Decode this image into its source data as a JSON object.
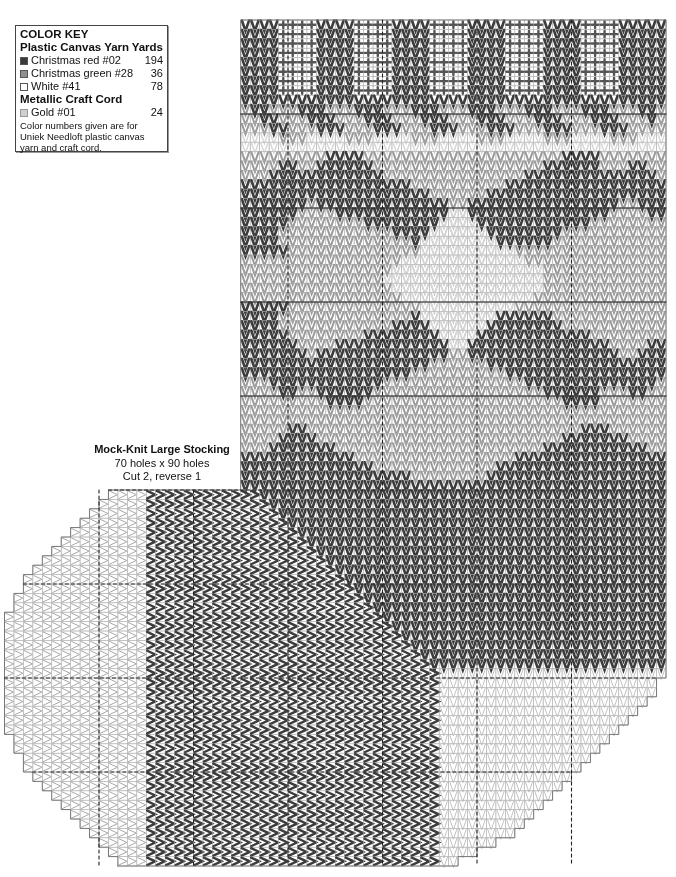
{
  "color_key": {
    "title": "COLOR KEY",
    "yarn_heading": "Plastic Canvas Yarn",
    "yards_heading": "Yards",
    "yarn_items": [
      {
        "name": "Christmas red #02",
        "yards": "194",
        "swatch": "#3a3a3a"
      },
      {
        "name": "Christmas green #28",
        "yards": "36",
        "swatch": "#8f8f8f"
      },
      {
        "name": "White #41",
        "yards": "78",
        "swatch": "#ffffff"
      }
    ],
    "cord_heading": "Metallic Craft Cord",
    "cord_items": [
      {
        "name": "Gold #01",
        "yards": "24",
        "swatch": "#cfcfcf"
      }
    ],
    "note": "Color numbers given are for Uniek Needloft plastic canvas yarn and craft cord."
  },
  "pattern_label": {
    "title": "Mock-Knit Large Stocking",
    "size": "70 holes x 90 holes",
    "cut": "Cut 2, reverse 1"
  },
  "chart_data": {
    "type": "stitch-chart",
    "title": "Mock-Knit Large Stocking",
    "grid": {
      "holes_wide": 70,
      "holes_high": 90,
      "major_every": 10
    },
    "colors": {
      "R": "#3c3c3c",
      "G": "#9a9a9a",
      "W": "#d6d6d6",
      "Y": "#bdbdbd"
    },
    "leg": {
      "start_col": 25,
      "cols": 45,
      "rows": 50
    },
    "foot": {
      "start_row": 50,
      "rows": 40
    },
    "leg_rows": [
      "RRRRWWWWRRRRWWWWRRRRWWWWRRRRWWWWRRRRWWWWRRRRR",
      "RRRRWWWWRRRRWWWWRRRRWWWWRRRRWWWWRRRRWWWWRRRRR",
      "RRRRWWWWRRRRWWWWRRRRWWWWRRRRWWWWRRRRWWWWRRRRR",
      "RRRRWWWWRRRRWWWWRRRRWWWWRRRRWWWWRRRRWWWWRRRRR",
      "RRRRWWWWRRRRWWWWRRRRWWWWRRRRWWWWRRRRWWWWRRRRR",
      "RRRRWWWWRRRRWWWWRRRRWWWWRRRRWWWWRRRRWWWWRRRRR",
      "RRRRWWWWRRRRWWWWRRRRWWWWRRRRWWWWRRRRWWWWRRRRR",
      "RRRRWWWWRRRRWWWWRRRRWWWWRRRRWWWWRRRRWWWWRRRRR",
      "RRRRRRRRRRRRRRRRRRRRRRRRRRRRRRRRRRRRRRRRRRRRR",
      "GRRGGGRRRGGGRRRGGGRRRGGGRRRGGGRRRGGGRRRGGGRRG",
      "GGRRGGGRRRGGGRRRGGGRRRGGGRRRGGGRRRGGGRRRGGGRG",
      "GGGRRGGGRRRGGGRRRGGGRRRGGGRRRGGGRRRGGGRRRGGGG",
      "WWWWGGGWWWWGGGWWWWGGGWWWWGGGWWWWGGGWWWWGGGWWW",
      "WWWWWWWWWWWWWWWWWWWWWWWWWWWWWWWWWWWWWWWWWWWWW",
      "GGGGGGGGGRRRRGGGGGGGGGGGGGGGGGGGGGRRRRGGGGGGG",
      "GGGGRRGGRRRRRRGGGGGGGGGGGGGGGGGGRRRRRRGGGRRGG",
      "GGGRRRRRRRRRRRRGGGGGGGGGGGGGGGRRRRRRRRRRRRRRG",
      "RRRRRRRRRRRRRRRRRRGGGGGGGGGGRRRRRRRRRRRRRRRRR",
      "RRRRRRRRRRRRRRRRRRRRGGGGGGRRRRRRRRRRRRRRRRRRR",
      "RRRRRRRGRRRRRRRRRRRRRRGGRRRRRRRRRRRRRRRRGGRRR",
      "RRRRRRGGGGRRRRRRRRRRRRYYRRRRRRRRRRRRRRRGGGGRR",
      "RRRRRGGGGGGGGRRRRRRRRYYYYRRRRRRRRRRRRGGGGGGGG",
      "RRRRGGGGGGGGGGGGRRRRYYYYYYRRRRRRRRGGGGGGGGGGG",
      "RRRRGGGGGGGGGGGGGGRYYYYYYYYRRRRRRGGGGGGGGGGGG",
      "RRRRRGGGGGGGGGGGGGGYYYYYYYYYYGGGGGGGGGGGGGGGG",
      "GGGGGGGGGGGGGGGGGYYYYYYYYYYYYYGGGGGGGGGGGGGGG",
      "GGGGGGGGGGGGGGGGYYYYYYYYYYYYYYYYGGGGGGGGGGGGG",
      "GGGGGGGGGGGGGGGYYYYYYYYYYYYYYYYYGGGGGGGGGGGGG",
      "GGGGGGGGGGGGGGGGYYYYYYYYYYYYYYYYGGGGGGGGGGGGG",
      "GGGGGGGGGGGGGGGGGYYYYYYYYYYYYYYGGGGGGGGGGGGGG",
      "RRRRRGGGGGGGGGGGGGGYYYYYYYYYYGGGGGGGGGGGGGGGG",
      "RRRRGGGGGGGGGGGGGGRYYYYYYYYRRRRRRGGGGGGGGGGGG",
      "RRRRGGGGGGGGGGGGRRRRYYYYYYRRRRRRRRGGGGGGGGGGG",
      "RRRRRGGGGGGGGRRRRRRRRYYYYRRRRRRRRRRRRGGGGGGGG",
      "RRRRRRGGGGRRRRRRRRRRRRYYRRRRRRRRRRRRRRRGGGGRR",
      "RRRRRRRGRRRRRRRRRRRRRRGGRRRRRRRRRRRRRRRRGGRRR",
      "RRRRRRRRRRRRRRRRRRRRGGGGGGRRRRRRRRRRRRRRRRRRR",
      "RRRRRRRRRRRRRRRRRRGGGGGGGGGGRRRRRRRRRRRRRRRRR",
      "GGGRRRRRRRRRRRRGGGGGGGGGGGGGGGRRRRRRRRRRRRRRG",
      "GGGGRRGGRRRRRRGGGGGGGGGGGGGGGGGGRRRRRRGGGRRGG",
      "GGGGGGGGGRRRRGGGGGGGGGGGGGGGGGGGGGRRRRGGGGGGG",
      "GGGGGGGGGGGGGGGGGGGGGGGGGGGGGGGGGGGGGGGGGGGGG",
      "GGGGGGGGGGGGGGGGGGGGGGGGGGGGGGGGGGGGGGGGGGGGG",
      "GGGGGRRGGGGGGGGGGGGGGGGGGGGGGGGGGGGGRRRGGGGGG",
      "GGGGRRRRGGGGGGGGGGGGGGGGGGGGGGGGGGRRRRRRRGGGG",
      "GGGRRRRRRRGGGGGGGGGGGGGGGGGGGGGGRRRRRRRRRRRGG",
      "RRRRRRRRRRRRGGGGGGGGGGGGGGGGGRRRRRRRRRRRRRRRR",
      "RRRRRRRRRRRRRRGGGGGGGGGGGGGRRRRRRRRRRRRRRRRRR",
      "RRRRRRRRRRRRRRRRRRGGGGGGGGRRRRRRRRRRRRRRRRRRR",
      "RRRRRRRRRRRRRRRRRRRRRRRRRRRRRRRRRRRRRRRRRRRRR"
    ],
    "foot_outline_left": [
      11,
      10,
      9,
      8,
      7,
      6,
      5,
      4,
      3,
      2,
      2,
      1,
      1,
      0,
      0,
      0,
      0,
      0,
      0,
      0,
      0,
      0,
      0,
      0,
      0,
      0,
      1,
      1,
      2,
      2,
      3,
      4,
      5,
      6,
      7,
      8,
      9,
      10,
      11,
      12
    ],
    "foot_outline_right": [
      70,
      70,
      70,
      70,
      70,
      70,
      70,
      70,
      70,
      70,
      70,
      70,
      70,
      70,
      70,
      70,
      70,
      70,
      70,
      70,
      69,
      69,
      68,
      67,
      66,
      65,
      64,
      63,
      62,
      61,
      60,
      59,
      58,
      57,
      56,
      55,
      54,
      52,
      50,
      48
    ],
    "foot_white_left_cols": 15,
    "toe_heel_white_rows_from": 69,
    "heel_diagonal": "red chevrons sideways in columns 15+ of the foot; heel diagonal runs from col 27 at row 50 to col 46 at row 69; white toe region bottom-right below row 69"
  }
}
